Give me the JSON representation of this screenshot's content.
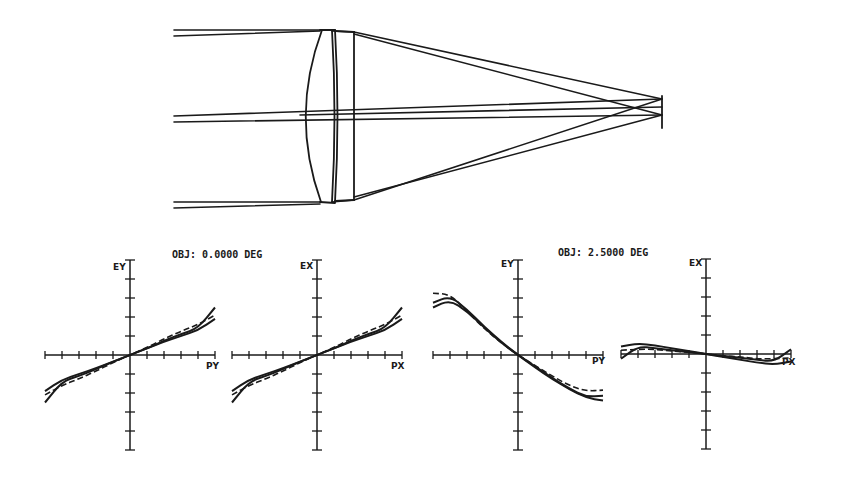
{
  "figure": {
    "background": "#ffffff",
    "ink_color": "#1a1a1a",
    "lens_diagram": {
      "description": "Cemented doublet lens layout with three ray bundles converging to image plane",
      "field_bundles": [
        "on-axis",
        "upper edge",
        "lower edge"
      ]
    },
    "groups": [
      {
        "title": "OBJ: 0.0000 DEG"
      },
      {
        "title": "OBJ: 2.5000 DEG"
      }
    ],
    "plots": [
      {
        "y_label": "EY",
        "x_label": "PY"
      },
      {
        "y_label": "EX",
        "x_label": "PX"
      },
      {
        "y_label": "EY",
        "x_label": "PY"
      },
      {
        "y_label": "EX",
        "x_label": "PX"
      }
    ]
  },
  "chart_data": [
    {
      "type": "line",
      "title": "OBJ: 0.0000 DEG",
      "xlabel": "PY",
      "ylabel": "EY",
      "xlim": [
        -1,
        1
      ],
      "ylim": [
        -1,
        1
      ],
      "x_ticks_per_side": 5,
      "y_ticks_per_side": 5,
      "grid": false,
      "x": [
        -1,
        -0.8,
        -0.6,
        -0.4,
        -0.2,
        0,
        0.2,
        0.4,
        0.6,
        0.8,
        1
      ],
      "series": [
        {
          "name": "solid-1",
          "style": "solid",
          "values": [
            -0.5,
            -0.28,
            -0.22,
            -0.15,
            -0.07,
            0,
            0.07,
            0.15,
            0.22,
            0.28,
            0.5
          ]
        },
        {
          "name": "solid-2",
          "style": "solid",
          "values": [
            -0.38,
            -0.26,
            -0.2,
            -0.14,
            -0.07,
            0,
            0.07,
            0.14,
            0.2,
            0.26,
            0.38
          ]
        },
        {
          "name": "dashed",
          "style": "dashed",
          "values": [
            -0.42,
            -0.32,
            -0.25,
            -0.17,
            -0.08,
            0,
            0.08,
            0.17,
            0.25,
            0.32,
            0.42
          ]
        }
      ]
    },
    {
      "type": "line",
      "title": "OBJ: 0.0000 DEG",
      "xlabel": "PX",
      "ylabel": "EX",
      "xlim": [
        -1,
        1
      ],
      "ylim": [
        -1,
        1
      ],
      "x_ticks_per_side": 5,
      "y_ticks_per_side": 5,
      "grid": false,
      "x": [
        -1,
        -0.8,
        -0.6,
        -0.4,
        -0.2,
        0,
        0.2,
        0.4,
        0.6,
        0.8,
        1
      ],
      "series": [
        {
          "name": "solid-1",
          "style": "solid",
          "values": [
            -0.5,
            -0.28,
            -0.22,
            -0.15,
            -0.07,
            0,
            0.07,
            0.15,
            0.22,
            0.28,
            0.5
          ]
        },
        {
          "name": "solid-2",
          "style": "solid",
          "values": [
            -0.38,
            -0.26,
            -0.2,
            -0.14,
            -0.07,
            0,
            0.07,
            0.14,
            0.2,
            0.26,
            0.38
          ]
        },
        {
          "name": "dashed",
          "style": "dashed",
          "values": [
            -0.42,
            -0.32,
            -0.25,
            -0.17,
            -0.08,
            0,
            0.08,
            0.17,
            0.25,
            0.32,
            0.42
          ]
        }
      ]
    },
    {
      "type": "line",
      "title": "OBJ: 2.5000 DEG",
      "xlabel": "PY",
      "ylabel": "EY",
      "xlim": [
        -1,
        1
      ],
      "ylim": [
        -1,
        1
      ],
      "x_ticks_per_side": 5,
      "y_ticks_per_side": 5,
      "grid": false,
      "x": [
        -1,
        -0.8,
        -0.6,
        -0.4,
        -0.2,
        0,
        0.2,
        0.4,
        0.6,
        0.8,
        1
      ],
      "series": [
        {
          "name": "solid-1",
          "style": "solid",
          "values": [
            0.55,
            0.62,
            0.48,
            0.3,
            0.14,
            0,
            -0.13,
            -0.25,
            -0.36,
            -0.45,
            -0.48
          ]
        },
        {
          "name": "solid-2",
          "style": "solid",
          "values": [
            0.5,
            0.58,
            0.46,
            0.29,
            0.13,
            0,
            -0.12,
            -0.24,
            -0.35,
            -0.44,
            -0.43
          ]
        },
        {
          "name": "dashed",
          "style": "dashed",
          "values": [
            0.65,
            0.64,
            0.46,
            0.28,
            0.13,
            0,
            -0.11,
            -0.22,
            -0.32,
            -0.38,
            -0.37
          ]
        }
      ]
    },
    {
      "type": "line",
      "title": "OBJ: 2.5000 DEG",
      "xlabel": "PX",
      "ylabel": "EX",
      "xlim": [
        -1,
        1
      ],
      "ylim": [
        -1,
        1
      ],
      "x_ticks_per_side": 5,
      "y_ticks_per_side": 5,
      "grid": false,
      "x": [
        -1,
        -0.8,
        -0.6,
        -0.4,
        -0.2,
        0,
        0.2,
        0.4,
        0.6,
        0.8,
        1
      ],
      "series": [
        {
          "name": "solid-1",
          "style": "solid",
          "values": [
            0.08,
            0.11,
            0.09,
            0.06,
            0.03,
            0,
            -0.03,
            -0.06,
            -0.09,
            -0.11,
            -0.08
          ]
        },
        {
          "name": "solid-2",
          "style": "solid",
          "values": [
            -0.05,
            0.08,
            0.06,
            0.04,
            0.02,
            0,
            -0.02,
            -0.04,
            -0.06,
            -0.08,
            0.05
          ]
        },
        {
          "name": "dashed",
          "style": "dashed",
          "values": [
            0.04,
            0.05,
            0.05,
            0.03,
            0.02,
            0,
            -0.02,
            -0.03,
            -0.05,
            -0.05,
            -0.04
          ]
        }
      ]
    }
  ]
}
